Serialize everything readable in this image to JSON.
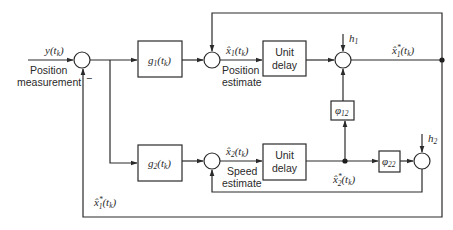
{
  "diagram": {
    "type": "block-diagram",
    "input": {
      "signal": "y(t_k)",
      "label_line1": "Position",
      "label_line2": "measurement"
    },
    "input_summer": {
      "sign_feedback": "−"
    },
    "blocks": {
      "g1": {
        "label": "g",
        "sub": "1",
        "arg": "(t",
        "argsub": "k",
        "close": ")"
      },
      "g2": {
        "label": "g",
        "sub": "2",
        "arg": "(t",
        "argsub": "k",
        "close": ")"
      },
      "delay1": {
        "line1": "Unit",
        "line2": "delay"
      },
      "delay2": {
        "line1": "Unit",
        "line2": "delay"
      },
      "phi12": {
        "label": "φ",
        "sub": "12"
      },
      "phi22": {
        "label": "φ",
        "sub": "22"
      }
    },
    "signals": {
      "x1_hat": {
        "label": "x̂",
        "sub": "1",
        "arg": "(t",
        "argsub": "k",
        "close": ")",
        "caption1": "Position",
        "caption2": "estimate"
      },
      "x2_hat": {
        "label": "x̂",
        "sub": "2",
        "arg": "(t",
        "argsub": "k",
        "close": ")",
        "caption1": "Speed",
        "caption2": "estimate"
      },
      "x1_pred": {
        "label": "x̂",
        "sup": "*",
        "sub": "1",
        "arg": "(t",
        "argsub": "k",
        "close": ")"
      },
      "x2_pred": {
        "label": "x̂",
        "sup": "*",
        "sub": "2",
        "arg": "(t",
        "argsub": "k",
        "close": ")"
      },
      "x1_pred_feedback": {
        "label": "x̂",
        "sup": "*",
        "sub": "1",
        "arg": "(t",
        "argsub": "k",
        "close": ")"
      }
    },
    "gains": {
      "h1": {
        "label": "h",
        "sub": "1"
      },
      "h2": {
        "label": "h",
        "sub": "2"
      }
    }
  }
}
